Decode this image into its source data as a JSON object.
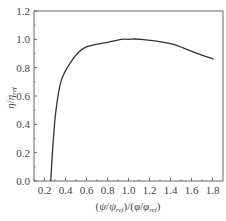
{
  "chart_data": {
    "type": "line",
    "title": "",
    "xlabel": "(ψ/ψ_ref)/(φ/φ_ref)",
    "ylabel": "η/η_ref",
    "xlim": [
      0.1,
      1.9
    ],
    "ylim": [
      0.0,
      1.2
    ],
    "xticks": [
      "0.2",
      "0.4",
      "0.6",
      "0.8",
      "1.0",
      "1.2",
      "1.4",
      "1.6",
      "1.8"
    ],
    "yticks": [
      "0.0",
      "0.2",
      "0.4",
      "0.6",
      "0.8",
      "1.0",
      "1.2"
    ],
    "grid": false,
    "legend": null,
    "series": [
      {
        "name": "η/η_ref",
        "color": "#333333",
        "x": [
          0.26,
          0.28,
          0.31,
          0.36,
          0.46,
          0.58,
          0.81,
          0.93,
          1.0,
          1.12,
          1.4,
          1.62,
          1.81
        ],
        "y": [
          0.0,
          0.25,
          0.5,
          0.71,
          0.85,
          0.94,
          0.98,
          1.0,
          1.0,
          1.0,
          0.97,
          0.91,
          0.86
        ]
      }
    ]
  },
  "labels": {
    "xlabel_parts": {
      "open": "(",
      "psi": "ψ",
      "slash": "/",
      "psi_ref": "ψ",
      "ref": "ref",
      "mid": ")/(",
      "phi": "φ",
      "phi_ref": "φ",
      "close": ")"
    },
    "ylabel_parts": {
      "eta": "η",
      "slash": "/",
      "eta_ref": "η",
      "ref": "ref"
    }
  }
}
